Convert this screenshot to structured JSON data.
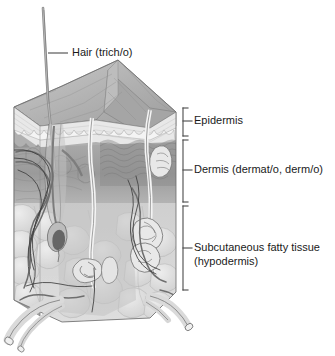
{
  "figure": {
    "type": "anatomical-illustration",
    "orientation": "three-dimensional block diagram",
    "palette": {
      "background": "#ffffff",
      "text": "#1a1a1a",
      "leader_line": "#4a4a4a",
      "bracket": "#4a4a4a",
      "surface_top": "#b4b4b4",
      "surface_top_light": "#c8c8c8",
      "epidermis_band": "#efefef",
      "epidermis_dark": "#8e8e8e",
      "dermis": "#9e9e9e",
      "dermis_dark": "#7b7b7b",
      "dermis_light": "#bdbdbd",
      "subcutaneous": "#d2d2d2",
      "fat_lobule": "#e2e2e2",
      "fat_lobule_shadow": "#c4c4c4",
      "vessel": "#6b6b6b",
      "nerve": "#3d3d3d",
      "hair_shaft": "#8a8a8a",
      "duct": "#f2f2f2",
      "outline": "#555555"
    }
  },
  "callouts": [
    {
      "id": "hair",
      "label": "Hair (trich/o)",
      "term": "Hair",
      "combining_forms": "trich/o",
      "marker": "leader-line",
      "label_x": 72,
      "label_y": 47,
      "leader_x1": 48,
      "leader_x2": 68,
      "leader_y": 53
    }
  ],
  "layers": [
    {
      "id": "epidermis",
      "label": "Epidermis",
      "term": "Epidermis",
      "combining_forms": "",
      "lines": [
        "Epidermis"
      ],
      "marker": "bracket",
      "bracket_top": 108,
      "bracket_bottom": 136,
      "label_x": 196,
      "label_y": 115
    },
    {
      "id": "dermis",
      "label": "Dermis (dermat/o, derm/o)",
      "term": "Dermis",
      "combining_forms": "dermat/o, derm/o",
      "lines": [
        "Dermis (dermat/o, derm/o)"
      ],
      "marker": "bracket",
      "bracket_top": 140,
      "bracket_bottom": 202,
      "label_x": 196,
      "label_y": 164
    },
    {
      "id": "subcutaneous",
      "label": "Subcutaneous fatty tissue (hypodermis)",
      "term": "Subcutaneous fatty tissue",
      "combining_forms": "hypodermis",
      "lines": [
        "Subcutaneous fatty tissue",
        "(hypodermis)"
      ],
      "marker": "bracket",
      "bracket_top": 206,
      "bracket_bottom": 290,
      "label_x": 196,
      "label_y": 242
    }
  ],
  "structures": [
    {
      "id": "hair-shaft",
      "name": "hair shaft"
    },
    {
      "id": "hair-follicle",
      "name": "hair follicle"
    },
    {
      "id": "hair-bulb",
      "name": "hair bulb"
    },
    {
      "id": "sweat-duct",
      "name": "sweat gland duct"
    },
    {
      "id": "sweat-gland",
      "name": "coiled sweat gland"
    },
    {
      "id": "sensory-receptor",
      "name": "sensory receptor"
    },
    {
      "id": "blood-vessels",
      "name": "blood vessels"
    },
    {
      "id": "nerve-fibers",
      "name": "nerve fibers"
    },
    {
      "id": "fat-lobules",
      "name": "fat lobules"
    },
    {
      "id": "dermal-papillae",
      "name": "dermal papillae"
    }
  ]
}
